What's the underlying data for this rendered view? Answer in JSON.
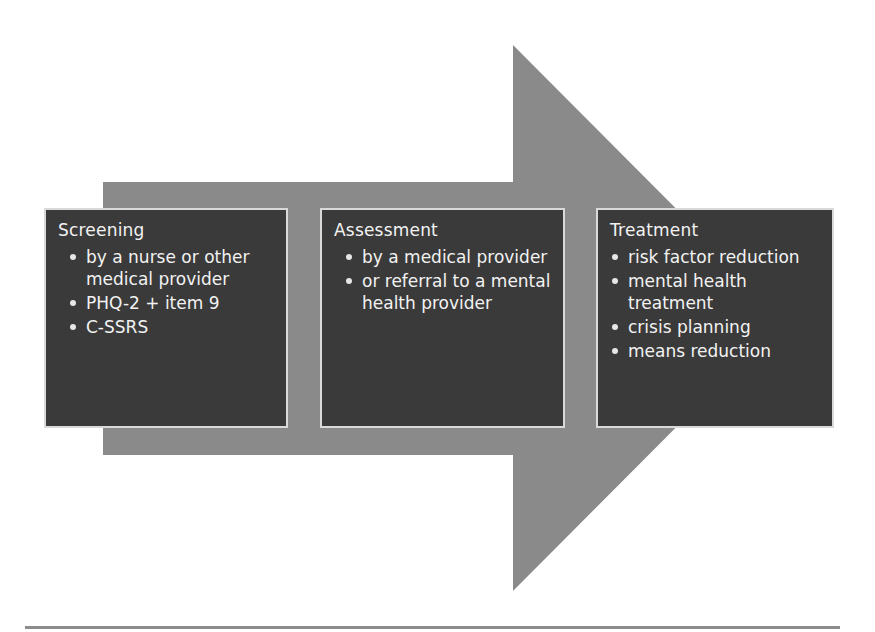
{
  "diagram": {
    "type": "process-arrow",
    "colors": {
      "arrow": "#8a8a8a",
      "box_fill": "#3a3a3a",
      "box_border": "#d9d9d9",
      "text": "#f2f2f2",
      "rule": "#8c8c8c"
    },
    "steps": [
      {
        "title": "Screening",
        "items": [
          "by a nurse or other medical provider",
          "PHQ-2 + item 9",
          "C-SSRS"
        ]
      },
      {
        "title": "Assessment",
        "items": [
          "by a medical provider",
          "or referral to a mental health provider"
        ]
      },
      {
        "title": "Treatment",
        "items": [
          "risk factor reduction",
          "mental health treatment",
          "crisis planning",
          "means reduction"
        ]
      }
    ]
  }
}
